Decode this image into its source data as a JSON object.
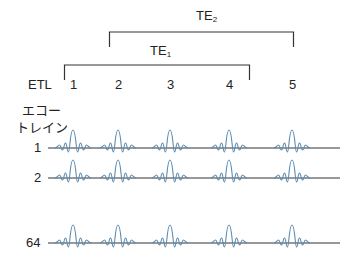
{
  "labels": {
    "te2": {
      "main": "TE",
      "sub": "2"
    },
    "te1": {
      "main": "TE",
      "sub": "1"
    },
    "etl": "ETL",
    "echo_train_line1": "エコー",
    "echo_train_line2": "トレイン"
  },
  "etl_numbers": [
    "1",
    "2",
    "3",
    "4",
    "5"
  ],
  "rows": [
    {
      "label": "1"
    },
    {
      "label": "2"
    },
    {
      "label": "64"
    }
  ],
  "colors": {
    "echo_wave": "#5b8bb0",
    "baseline": "#333333",
    "bracket": "#333333"
  }
}
